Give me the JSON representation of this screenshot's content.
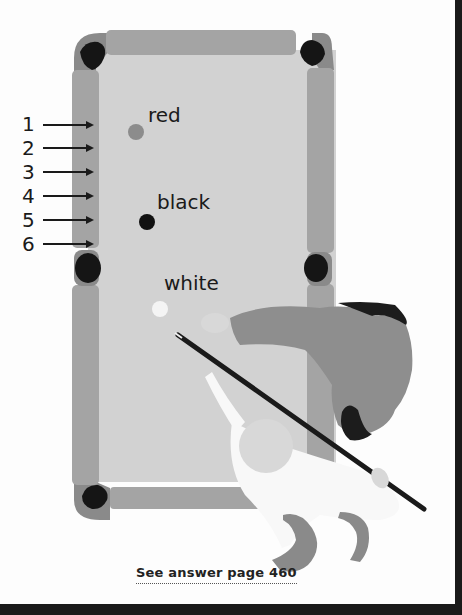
{
  "diagram": {
    "colors": {
      "cloth": "#d2d2d2",
      "cushion": "#a4a4a4",
      "corner_cushion": "#8a8a8a",
      "pocket": "#151515",
      "red_ball": "#8c8c8c",
      "black_ball": "#111111",
      "white_ball": "#f4f4f4",
      "player_shirt": "#8e8e8e",
      "cue": "#1a1a1a"
    },
    "diamond_markers": [
      {
        "label": "1"
      },
      {
        "label": "2"
      },
      {
        "label": "3"
      },
      {
        "label": "4"
      },
      {
        "label": "5"
      },
      {
        "label": "6"
      }
    ],
    "balls": {
      "red": {
        "label": "red"
      },
      "black": {
        "label": "black"
      },
      "white": {
        "label": "white"
      }
    },
    "footer": {
      "answer_link": "See answer page 460"
    }
  }
}
